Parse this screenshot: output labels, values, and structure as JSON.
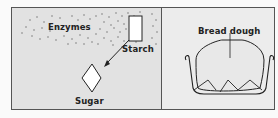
{
  "diagram": {
    "left_panel": {
      "labels": {
        "enzymes": "Enzymes",
        "starch": "Starch",
        "sugar": "Sugar"
      }
    },
    "right_panel": {
      "labels": {
        "bread_dough": "Bread dough"
      }
    },
    "colors": {
      "left_background": "#e2e2e2",
      "right_background": "#ececec",
      "line": "#222222"
    }
  }
}
